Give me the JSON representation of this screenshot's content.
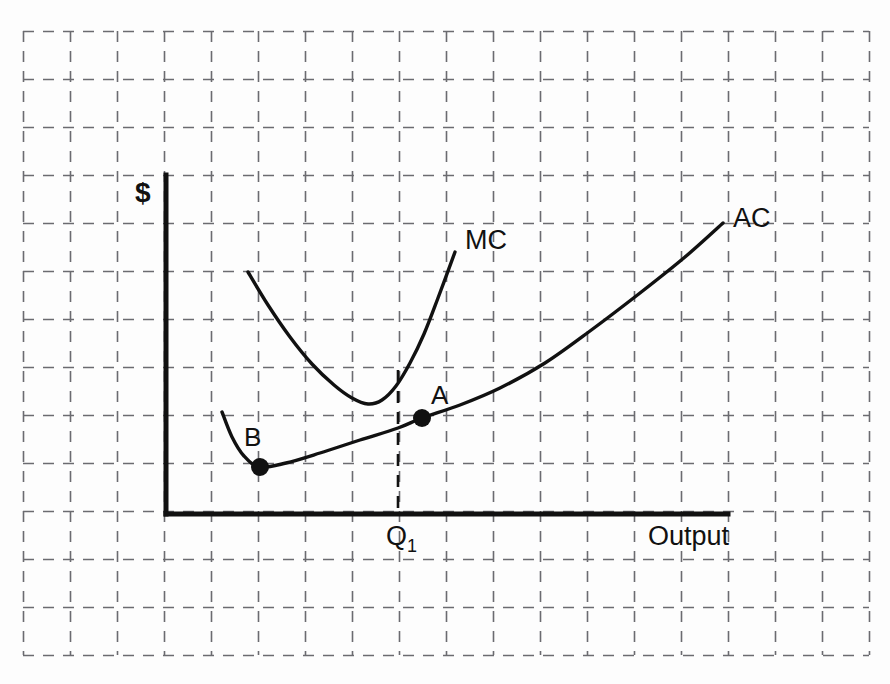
{
  "figure": {
    "title": "",
    "background_color": "#fdfdfd",
    "ink_color": "#111111",
    "grid_color": "#6b6b70"
  },
  "axes": {
    "y_axis_label": "$",
    "x_axis_label": "Output",
    "origin": {
      "x": 166,
      "y": 514
    },
    "y_axis_top": {
      "x": 166,
      "y": 175
    },
    "x_axis_right": {
      "x": 728,
      "y": 514
    }
  },
  "grid": {
    "visible": true,
    "style": "dashed",
    "left": 23,
    "top": 31,
    "right": 869,
    "bottom": 655,
    "column_count": 18,
    "row_count": 13,
    "cell_width": 47,
    "cell_height": 48
  },
  "curves": [
    {
      "name": "MC",
      "label": "MC",
      "label_x": 465,
      "label_y": 249,
      "description": "Marginal cost curve, U-shaped, steeply rising"
    },
    {
      "name": "AC",
      "label": "AC",
      "label_x": 733,
      "label_y": 227,
      "description": "Average cost curve, U-shaped with minimum at point B"
    }
  ],
  "points": [
    {
      "id": "A",
      "label": "A",
      "x": 422,
      "y": 418,
      "label_x": 431,
      "label_y": 404,
      "note": "Point on AC curve to the right of the minimum"
    },
    {
      "id": "B",
      "label": "B",
      "x": 260,
      "y": 467,
      "label_x": 244,
      "label_y": 446,
      "note": "Minimum of the AC curve"
    }
  ],
  "markers": [
    {
      "id": "Q1",
      "label": "Q",
      "subscript": "1",
      "label_x": 386,
      "label_y": 545,
      "dropline_x": 398,
      "dropline_top_y": 370,
      "dropline_bottom_y": 514
    }
  ],
  "chart_data": {
    "type": "line",
    "title": "",
    "xlabel": "Output",
    "ylabel": "$",
    "grid": true,
    "legend": "inline-curve-labels",
    "annotations": [
      {
        "text": "MC",
        "x": 465,
        "y": 249
      },
      {
        "text": "AC",
        "x": 733,
        "y": 227
      },
      {
        "text": "A",
        "x": 431,
        "y": 404
      },
      {
        "text": "B",
        "x": 244,
        "y": 446
      },
      {
        "text": "Q1",
        "x": 386,
        "y": 545
      }
    ],
    "series": [
      {
        "name": "MC",
        "label": "MC",
        "points": [
          [
            248,
            272
          ],
          [
            268,
            305
          ],
          [
            290,
            337
          ],
          [
            312,
            364
          ],
          [
            334,
            385
          ],
          [
            352,
            398
          ],
          [
            368,
            404
          ],
          [
            382,
            400
          ],
          [
            396,
            386
          ],
          [
            410,
            363
          ],
          [
            424,
            334
          ],
          [
            438,
            298
          ],
          [
            455,
            252
          ]
        ]
      },
      {
        "name": "AC",
        "label": "AC",
        "points": [
          [
            222,
            412
          ],
          [
            232,
            437
          ],
          [
            244,
            456
          ],
          [
            260,
            467
          ],
          [
            286,
            463
          ],
          [
            320,
            453
          ],
          [
            360,
            440
          ],
          [
            398,
            428
          ],
          [
            422,
            418
          ],
          [
            460,
            405
          ],
          [
            500,
            388
          ],
          [
            545,
            363
          ],
          [
            590,
            331
          ],
          [
            640,
            293
          ],
          [
            685,
            257
          ],
          [
            723,
            223
          ]
        ]
      }
    ],
    "special_points": [
      {
        "name": "A",
        "x": 422,
        "y": 418,
        "on_series": "AC"
      },
      {
        "name": "B",
        "x": 260,
        "y": 467,
        "on_series": "AC",
        "is_minimum": true
      }
    ],
    "reference_lines": [
      {
        "name": "Q1",
        "type": "vertical",
        "x": 398,
        "y_from": 370,
        "y_to": 514,
        "style": "dashed"
      }
    ]
  }
}
